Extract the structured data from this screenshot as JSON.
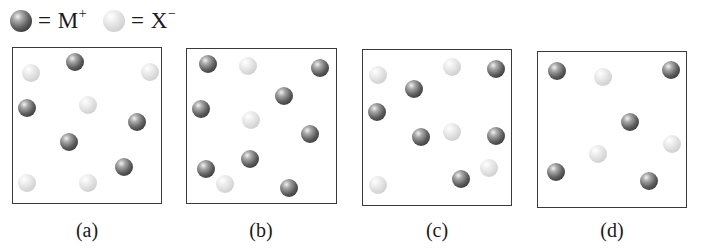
{
  "legend": {
    "items": [
      {
        "type": "dark",
        "symbol": "M",
        "charge": "+",
        "label": "= M⁺"
      },
      {
        "type": "light",
        "symbol": "X",
        "charge": "−",
        "label": "= X⁻"
      }
    ]
  },
  "panels": [
    {
      "label": "(a)",
      "box": {
        "x": 12,
        "y": 47,
        "w": 150,
        "h": 157
      },
      "caption_x": 87,
      "particles": [
        {
          "type": "dark",
          "x": 75,
          "y": 62
        },
        {
          "type": "light",
          "x": 31,
          "y": 73
        },
        {
          "type": "light",
          "x": 150,
          "y": 72
        },
        {
          "type": "dark",
          "x": 27,
          "y": 108
        },
        {
          "type": "light",
          "x": 88,
          "y": 105
        },
        {
          "type": "dark",
          "x": 137,
          "y": 122
        },
        {
          "type": "dark",
          "x": 69,
          "y": 142
        },
        {
          "type": "dark",
          "x": 124,
          "y": 167
        },
        {
          "type": "light",
          "x": 27,
          "y": 183
        },
        {
          "type": "light",
          "x": 88,
          "y": 183
        }
      ]
    },
    {
      "label": "(b)",
      "box": {
        "x": 186,
        "y": 48,
        "w": 151,
        "h": 156
      },
      "caption_x": 261,
      "particles": [
        {
          "type": "dark",
          "x": 208,
          "y": 64
        },
        {
          "type": "light",
          "x": 248,
          "y": 66
        },
        {
          "type": "dark",
          "x": 320,
          "y": 68
        },
        {
          "type": "dark",
          "x": 284,
          "y": 96
        },
        {
          "type": "dark",
          "x": 201,
          "y": 109
        },
        {
          "type": "light",
          "x": 251,
          "y": 120
        },
        {
          "type": "dark",
          "x": 310,
          "y": 134
        },
        {
          "type": "dark",
          "x": 250,
          "y": 159
        },
        {
          "type": "dark",
          "x": 206,
          "y": 169
        },
        {
          "type": "light",
          "x": 225,
          "y": 184
        },
        {
          "type": "dark",
          "x": 289,
          "y": 188
        }
      ]
    },
    {
      "label": "(c)",
      "box": {
        "x": 362,
        "y": 49,
        "w": 150,
        "h": 157
      },
      "caption_x": 437,
      "particles": [
        {
          "type": "light",
          "x": 378,
          "y": 75
        },
        {
          "type": "light",
          "x": 452,
          "y": 67
        },
        {
          "type": "dark",
          "x": 496,
          "y": 69
        },
        {
          "type": "dark",
          "x": 414,
          "y": 89
        },
        {
          "type": "dark",
          "x": 377,
          "y": 112
        },
        {
          "type": "dark",
          "x": 421,
          "y": 137
        },
        {
          "type": "light",
          "x": 452,
          "y": 132
        },
        {
          "type": "dark",
          "x": 496,
          "y": 136
        },
        {
          "type": "light",
          "x": 489,
          "y": 168
        },
        {
          "type": "dark",
          "x": 461,
          "y": 179
        },
        {
          "type": "light",
          "x": 378,
          "y": 185
        }
      ]
    },
    {
      "label": "(d)",
      "box": {
        "x": 537,
        "y": 51,
        "w": 150,
        "h": 157
      },
      "caption_x": 612,
      "particles": [
        {
          "type": "dark",
          "x": 557,
          "y": 71
        },
        {
          "type": "light",
          "x": 603,
          "y": 77
        },
        {
          "type": "dark",
          "x": 671,
          "y": 70
        },
        {
          "type": "dark",
          "x": 630,
          "y": 122
        },
        {
          "type": "light",
          "x": 672,
          "y": 144
        },
        {
          "type": "light",
          "x": 598,
          "y": 154
        },
        {
          "type": "dark",
          "x": 556,
          "y": 172
        },
        {
          "type": "dark",
          "x": 649,
          "y": 181
        }
      ]
    }
  ]
}
